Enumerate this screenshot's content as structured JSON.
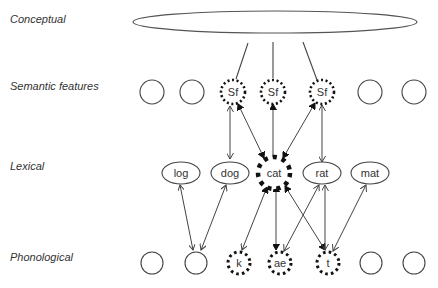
{
  "layers": {
    "conceptual": "Conceptual",
    "semantic": "Semantic features",
    "lexical": "Lexical",
    "phonological": "Phonological"
  },
  "semantic_nodes": [
    {
      "label": "",
      "active": false
    },
    {
      "label": "",
      "active": false
    },
    {
      "label": "Sf",
      "active": true
    },
    {
      "label": "Sf",
      "active": true
    },
    {
      "label": "Sf",
      "active": true
    },
    {
      "label": "",
      "active": false
    },
    {
      "label": "",
      "active": false
    }
  ],
  "lexical_nodes": [
    {
      "label": "log",
      "active": false
    },
    {
      "label": "dog",
      "active": false
    },
    {
      "label": "cat",
      "active": true
    },
    {
      "label": "rat",
      "active": false
    },
    {
      "label": "mat",
      "active": false
    }
  ],
  "phonological_nodes": [
    {
      "label": "",
      "active": false
    },
    {
      "label": "",
      "active": false
    },
    {
      "label": "k",
      "active": true
    },
    {
      "label": "ae",
      "active": true
    },
    {
      "label": "t",
      "active": true
    },
    {
      "label": "",
      "active": false
    },
    {
      "label": "",
      "active": false
    }
  ],
  "colors": {
    "stroke": "#444444",
    "text": "#333333",
    "active": "#111111"
  }
}
